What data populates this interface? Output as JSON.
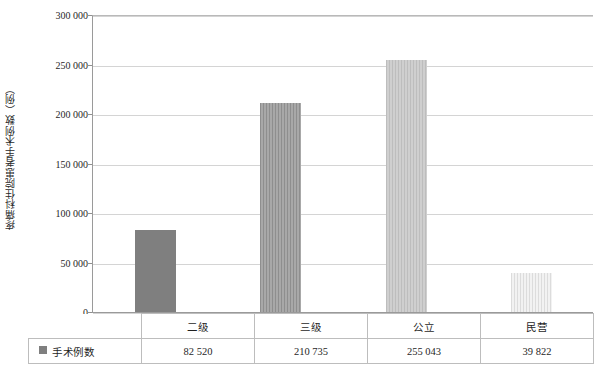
{
  "chart_data": {
    "type": "bar",
    "title": "",
    "xlabel": "",
    "ylabel": "疼痛科住院患者手术例数（例）",
    "categories": [
      "二级",
      "三级",
      "公立",
      "民营"
    ],
    "values": [
      82520,
      210735,
      255043,
      39822
    ],
    "value_labels": [
      "82 520",
      "210 735",
      "255 043",
      "39 822"
    ],
    "series": [
      {
        "name": "手术例数",
        "values": [
          82520,
          210735,
          255043,
          39822
        ]
      }
    ],
    "ylim": [
      0,
      300000
    ],
    "ytick_values": [
      0,
      50000,
      100000,
      150000,
      200000,
      250000,
      300000
    ],
    "ytick_labels": [
      "0",
      "50 000",
      "100 000",
      "150 000",
      "200 000",
      "250 000",
      "300 000"
    ],
    "grid": true,
    "legend_position": "table-left",
    "bar_colors": [
      "#7f7f7f",
      "#a0a0a0",
      "#c6c6c6",
      "#e8e8e8"
    ],
    "bar_fills": [
      "solid",
      "vertical-stripes",
      "vertical-stripes",
      "vertical-stripes"
    ]
  },
  "legend": {
    "swatch_color": "#7f7f7f",
    "label": "手术例数"
  },
  "table": {
    "category_row": [
      "二级",
      "三级",
      "公立",
      "民营"
    ],
    "value_row": [
      "82 520",
      "210 735",
      "255 043",
      "39 822"
    ]
  },
  "axis": {
    "y_title": "疼痛科住院患者手术例数（例）",
    "y_labels": [
      "300 000",
      "250 000",
      "200 000",
      "150 000",
      "100 000",
      "50 000",
      "0"
    ]
  }
}
